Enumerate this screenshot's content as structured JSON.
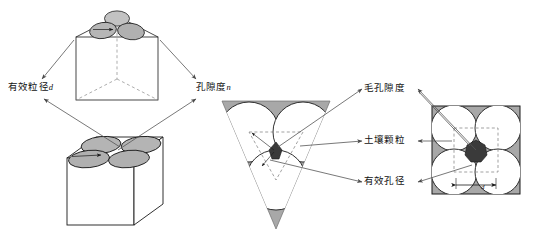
{
  "figure": {
    "background_color": "#ffffff",
    "line_color": "#1a1a1a",
    "arrow_color": "#4a4a4a",
    "particle_fill": "#b0b0b0",
    "shade_fill": "#a8a8a8",
    "pore_fill": "#3a3a3a",
    "circle_fill": "#ffffff"
  },
  "labels": {
    "effective_grain_diameter": "有效粒径",
    "effective_grain_diameter_symbol": "d",
    "porosity": "孔隙度",
    "porosity_symbol": "n",
    "capillary_porosity": "毛孔隙度",
    "soil_particle": "土壤颗粒",
    "effective_pore_diameter": "有效孔径",
    "dimension_symbol": "d"
  },
  "panels": {
    "left": {
      "name": "cube-pair-panel",
      "top_cube": {
        "name": "wireframe-cube-three-particles",
        "particle_count": 3,
        "edge_style": "dashed-hidden"
      },
      "bottom_cube": {
        "name": "solid-cube-four-particles",
        "particle_count": 4,
        "edge_style": "solid"
      }
    },
    "right": {
      "name": "packing-geometry-panel",
      "triangle": {
        "name": "triangular-packing",
        "circle_count": 3,
        "shade": "#a8a8a8",
        "inner_guide": "dashed-triangle"
      },
      "square": {
        "name": "square-packing",
        "circle_count": 4,
        "shade": "#a8a8a8",
        "inner_guide": "dashed-square",
        "dimension_line": true
      }
    }
  }
}
